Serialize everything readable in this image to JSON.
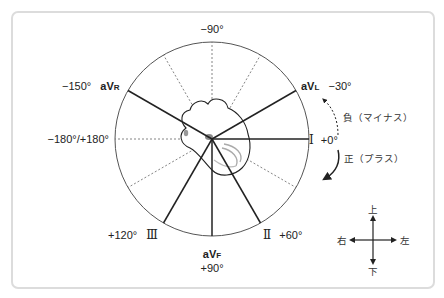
{
  "diagram": {
    "type": "hexaxial-reference-system",
    "center": {
      "x": 212,
      "y": 139
    },
    "radius": 97,
    "colors": {
      "frame_border": "#dcdcdc",
      "line": "#222222",
      "dashed": "#666666",
      "heart_shading": "#999999"
    },
    "leads": [
      {
        "name": "I",
        "angle_label": "+0°",
        "angle": 0
      },
      {
        "name": "II",
        "angle_label": "+60°",
        "angle": 60
      },
      {
        "name": "III",
        "angle_label": "+120°",
        "angle": 120
      },
      {
        "name": "aVR",
        "lead_prefix": "aV",
        "lead_suffix": "R",
        "angle_label": "−150°",
        "angle": -150
      },
      {
        "name": "aVL",
        "lead_prefix": "aV",
        "lead_suffix": "L",
        "angle_label": "−30°",
        "angle": -30
      },
      {
        "name": "aVF",
        "lead_prefix": "aV",
        "lead_suffix": "F",
        "angle_label": "+90°",
        "angle": 90
      }
    ],
    "axis_labels": {
      "top": "−90°",
      "left": "−180°/+180°"
    },
    "roman_numerals": {
      "I": "Ⅰ",
      "II": "Ⅱ",
      "III": "Ⅲ"
    },
    "rotation_labels": {
      "negative": "負（マイナス）",
      "positive": "正（プラス）"
    },
    "direction_cross": {
      "up": "上",
      "down": "下",
      "right_side_label": "右",
      "left_side_label": "左"
    }
  }
}
